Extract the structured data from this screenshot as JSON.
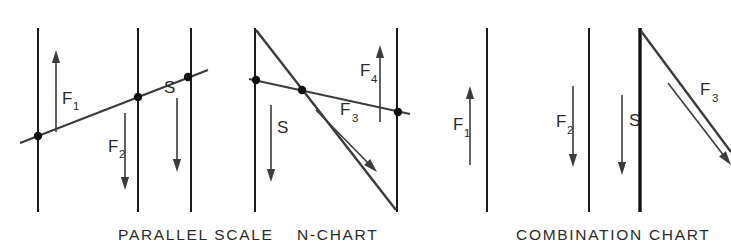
{
  "figure": {
    "title": "Nomogram chart types comparison",
    "background_color": "#ffffff",
    "line_color": "#3c3c3c",
    "axis_color": "#1a1a1a",
    "text_color": "#2b2b2b",
    "width": 731,
    "height": 248
  },
  "panels": [
    {
      "id": "parallel-scale",
      "caption": "PARALLEL SCALE",
      "caption_x": 118,
      "caption_y": 240,
      "axes": [
        {
          "name": "axis-f1",
          "x": 38,
          "y1": 28,
          "y2": 212,
          "weight": "normal"
        },
        {
          "name": "axis-f2",
          "x": 138,
          "y1": 28,
          "y2": 212,
          "weight": "normal"
        },
        {
          "name": "axis-s",
          "x": 191,
          "y1": 28,
          "y2": 212,
          "weight": "normal"
        },
        {
          "name": "axis-right",
          "x": 255,
          "y1": 28,
          "y2": 212,
          "weight": "normal"
        }
      ],
      "index_line": {
        "x1": 20,
        "y1": 143,
        "x2": 208,
        "y2": 70
      },
      "dots": [
        {
          "x": 38,
          "y": 136
        },
        {
          "x": 138,
          "y": 97
        },
        {
          "x": 188,
          "y": 77
        }
      ],
      "arrows": [
        {
          "label": "F",
          "sub": "1",
          "x": 56,
          "y_tail": 132,
          "y_head": 50,
          "direction": "up",
          "label_x": 62,
          "label_y": 104,
          "sub_x": 73,
          "sub_y": 110
        },
        {
          "label": "F",
          "sub": "2",
          "x": 125,
          "y_tail": 113,
          "y_head": 190,
          "direction": "down",
          "label_x": 108,
          "label_y": 152,
          "sub_x": 119,
          "sub_y": 158
        },
        {
          "label": "S",
          "sub": "",
          "x": 177,
          "y_tail": 98,
          "y_head": 172,
          "direction": "down",
          "label_x": 164,
          "label_y": 93,
          "sub_x": 0,
          "sub_y": 0
        }
      ]
    },
    {
      "id": "n-chart",
      "caption": "N-CHART",
      "caption_x": 297,
      "caption_y": 240,
      "axes": [
        {
          "name": "axis-s",
          "x": 255,
          "y1": 28,
          "y2": 212,
          "weight": "normal"
        },
        {
          "name": "axis-f4",
          "x": 397,
          "y1": 28,
          "y2": 212,
          "weight": "normal"
        }
      ],
      "diagonal": {
        "x1": 256,
        "y1": 30,
        "x2": 396,
        "y2": 210
      },
      "index_line": {
        "x1": 249,
        "y1": 79,
        "x2": 410,
        "y2": 114
      },
      "dots": [
        {
          "x": 256,
          "y": 80
        },
        {
          "x": 302,
          "y": 90
        },
        {
          "x": 398,
          "y": 112
        }
      ],
      "arrows": [
        {
          "label": "S",
          "sub": "",
          "x": 271,
          "y_tail": 105,
          "y_head": 182,
          "direction": "down",
          "label_x": 277,
          "label_y": 133,
          "sub_x": 0,
          "sub_y": 0
        },
        {
          "label": "F",
          "sub": "4",
          "x": 380,
          "y_tail": 122,
          "y_head": 45,
          "direction": "up",
          "label_x": 360,
          "label_y": 76,
          "sub_x": 371,
          "sub_y": 83
        }
      ],
      "diag_arrow": {
        "label": "F",
        "sub": "3",
        "x1": 316,
        "y1": 110,
        "x2": 377,
        "y2": 172,
        "label_x": 340,
        "label_y": 115,
        "sub_x": 352,
        "sub_y": 122
      }
    },
    {
      "id": "combination-chart",
      "caption": "COMBINATION CHART",
      "caption_x": 516,
      "caption_y": 240,
      "axes": [
        {
          "name": "axis-f1",
          "x": 487,
          "y1": 28,
          "y2": 212,
          "weight": "normal"
        },
        {
          "name": "axis-f2",
          "x": 589,
          "y1": 28,
          "y2": 212,
          "weight": "normal"
        },
        {
          "name": "axis-s",
          "x": 640,
          "y1": 28,
          "y2": 212,
          "weight": "heavy"
        }
      ],
      "diagonal": {
        "x1": 641,
        "y1": 31,
        "x2": 731,
        "y2": 152
      },
      "arrows": [
        {
          "label": "F",
          "sub": "1",
          "x": 470,
          "y_tail": 165,
          "y_head": 86,
          "direction": "up",
          "label_x": 453,
          "label_y": 130,
          "sub_x": 464,
          "sub_y": 137
        },
        {
          "label": "F",
          "sub": "2",
          "x": 573,
          "y_tail": 86,
          "y_head": 167,
          "direction": "down",
          "label_x": 556,
          "label_y": 127,
          "sub_x": 567,
          "sub_y": 134
        },
        {
          "label": "S",
          "sub": "",
          "x": 622,
          "y_tail": 95,
          "y_head": 175,
          "direction": "down",
          "label_x": 629,
          "label_y": 126,
          "sub_x": 0,
          "sub_y": 0
        }
      ],
      "diag_arrow": {
        "label": "F",
        "sub": "3",
        "x1": 668,
        "y1": 83,
        "x2": 731,
        "y2": 165,
        "label_x": 700,
        "label_y": 95,
        "sub_x": 712,
        "sub_y": 102
      }
    }
  ]
}
